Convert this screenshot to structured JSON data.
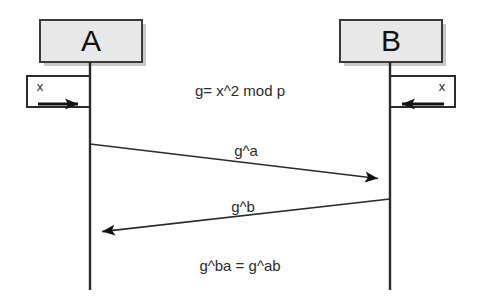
{
  "diagram": {
    "type": "sequence-diagram",
    "background_color": "#ffffff",
    "line_color": "#2b2b2b",
    "box_fill_color": "#e8e8e8",
    "box_border_color": "#3a3a3a",
    "shadow_color": "#9a9a9a",
    "actors": [
      {
        "id": "A",
        "label": "A",
        "box": {
          "x": 40,
          "y": 20,
          "width": 102,
          "height": 42
        },
        "lifeline_x": 90,
        "lifeline_top": 62,
        "lifeline_bottom": 290
      },
      {
        "id": "B",
        "label": "B",
        "box": {
          "x": 340,
          "y": 20,
          "width": 102,
          "height": 42
        },
        "lifeline_x": 390,
        "lifeline_top": 62,
        "lifeline_bottom": 290
      }
    ],
    "input_boxes": [
      {
        "id": "input-a",
        "label": "x",
        "side": "left",
        "box": {
          "x": 27,
          "y": 76,
          "width": 63,
          "height": 31
        },
        "arrow": {
          "from_x": 35,
          "to_x": 90,
          "y": 104,
          "direction": "right"
        }
      },
      {
        "id": "input-b",
        "label": "x",
        "side": "right",
        "box": {
          "x": 390,
          "y": 76,
          "width": 65,
          "height": 31
        },
        "arrow": {
          "from_x": 447,
          "to_x": 390,
          "y": 104,
          "direction": "left"
        }
      }
    ],
    "messages": [
      {
        "id": "msg-g-a",
        "label": "g^a",
        "from": "A",
        "to": "B",
        "from_x": 90,
        "from_y": 144,
        "to_x": 390,
        "to_y": 180,
        "label_x": 246,
        "label_y": 152
      },
      {
        "id": "msg-g-b",
        "label": "g^b",
        "from": "B",
        "to": "A",
        "from_x": 390,
        "from_y": 199,
        "to_x": 90,
        "to_y": 233,
        "label_x": 243,
        "label_y": 208
      }
    ],
    "annotations": [
      {
        "id": "note-generator",
        "label": "g= x^2 mod p",
        "x": 240,
        "y": 92
      },
      {
        "id": "note-shared-secret",
        "label": "g^ba = g^ab",
        "x": 240,
        "y": 267
      }
    ]
  }
}
